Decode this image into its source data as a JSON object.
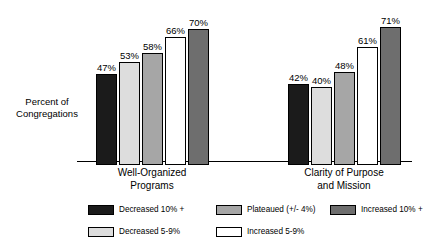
{
  "chart_data": {
    "type": "bar",
    "title": "",
    "subtitle": "",
    "xlabel": "",
    "ylabel_lines": [
      "Percent of",
      "Congregations"
    ],
    "categories": [
      "Well-Organized Programs",
      "Clarity of Purpose and Mission"
    ],
    "category_label_lines": [
      [
        "Well-Organized",
        "Programs"
      ],
      [
        "Clarity of Purpose",
        "and Mission"
      ]
    ],
    "series": [
      {
        "name": "Decreased 10% +",
        "color": "#1b1b1b",
        "values": [
          47,
          42
        ]
      },
      {
        "name": "Decreased 5-9%",
        "color": "#dddddd",
        "values": [
          53,
          40
        ]
      },
      {
        "name": "Plateaued (+/- 4%)",
        "color": "#a6a6a6",
        "values": [
          58,
          48
        ]
      },
      {
        "name": "Increased 5-9%",
        "color": "#ffffff",
        "values": [
          66,
          61
        ]
      },
      {
        "name": "Increased 10% +",
        "color": "#6e6e6e",
        "values": [
          70,
          71
        ]
      }
    ],
    "value_labels": [
      [
        "47%",
        "53%",
        "58%",
        "66%",
        "70%"
      ],
      [
        "42%",
        "40%",
        "48%",
        "61%",
        "71%"
      ]
    ],
    "ylim": [
      0,
      83
    ],
    "grid": false,
    "legend_position": "bottom",
    "axis_color": "#000000",
    "background": "#ffffff"
  },
  "legend": {
    "items": [
      {
        "label": "Decreased 10% +",
        "color": "#1b1b1b"
      },
      {
        "label": "Decreased 5-9%",
        "color": "#dddddd"
      },
      {
        "label": "Plateaued (+/- 4%)",
        "color": "#a6a6a6"
      },
      {
        "label": "Increased 5-9%",
        "color": "#ffffff"
      },
      {
        "label": "Increased 10% +",
        "color": "#6e6e6e"
      }
    ]
  }
}
